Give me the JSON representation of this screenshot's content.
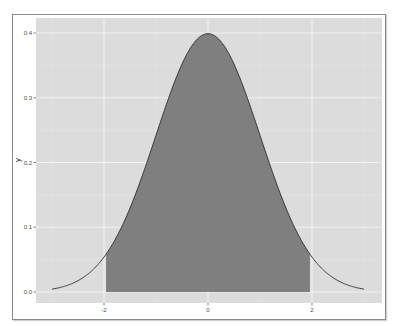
{
  "chart_data": {
    "type": "area",
    "title": "",
    "xlabel": "",
    "ylabel": "y",
    "distribution": {
      "name": "normal",
      "mean": 0,
      "sd": 1
    },
    "x_range": [
      -3,
      3
    ],
    "shaded_interval": [
      -1.96,
      1.96
    ],
    "xlim": [
      -3.3,
      3.3
    ],
    "ylim": [
      -0.02,
      0.42
    ],
    "x_ticks": [
      -2,
      0,
      2
    ],
    "x_tick_labels": [
      "-2",
      "0",
      "2"
    ],
    "y_ticks": [
      0.0,
      0.1,
      0.2,
      0.3,
      0.4
    ],
    "y_tick_labels": [
      "0.0",
      "0.1",
      "0.2",
      "0.3",
      "0.4"
    ],
    "peak": {
      "x": 0,
      "y": 0.3989
    },
    "grid": true,
    "legend": null,
    "colors": {
      "panel_background": "#dcdcdc",
      "grid_major": "#f2f2f2",
      "grid_minor": "#e8e8e8",
      "fill": "#7f7f7f",
      "curve": "#2b2b2b"
    }
  }
}
